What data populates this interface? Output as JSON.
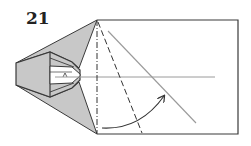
{
  "step": {
    "number": "21"
  },
  "diagram": {
    "colors": {
      "paper_white": "#ffffff",
      "paper_gray": "#c8c8c8",
      "outline": "#3a3a3a",
      "reference_line": "#9a9a9a",
      "fold_line": "#333333"
    },
    "elements": [
      {
        "type": "rectangle",
        "label": "paper-body"
      },
      {
        "type": "dash-dot-line",
        "label": "mountain-fold"
      },
      {
        "type": "dashed-line",
        "label": "valley-fold"
      },
      {
        "type": "line",
        "label": "reference-diagonal"
      },
      {
        "type": "line",
        "label": "horizontal-center-line"
      },
      {
        "type": "arrow",
        "label": "fold-direction-arrow"
      }
    ]
  }
}
